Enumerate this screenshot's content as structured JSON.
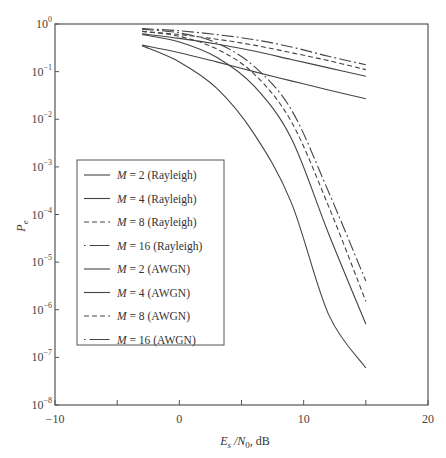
{
  "chart_data": {
    "type": "line",
    "title": "",
    "xlabel": "Es/N0, dB",
    "xlabel_parts": {
      "main": "E",
      "sub1": "s",
      "mid": " /N",
      "sub2": "0",
      "tail": ", dB"
    },
    "ylabel": "Pe",
    "ylabel_parts": {
      "main": "P",
      "sub": "e"
    },
    "xlim": [
      -10,
      20
    ],
    "ylim": [
      1e-08,
      1
    ],
    "yscale": "log",
    "grid": false,
    "legend_position": "center-left",
    "x_ticks": [
      {
        "value": -10,
        "label": "−10"
      },
      {
        "value": -5,
        "label": ""
      },
      {
        "value": 0,
        "label": "0"
      },
      {
        "value": 5,
        "label": ""
      },
      {
        "value": 10,
        "label": "10"
      },
      {
        "value": 15,
        "label": ""
      },
      {
        "value": 20,
        "label": "20"
      }
    ],
    "y_ticks": [
      {
        "exp": 0,
        "label": "10",
        "sup": "0"
      },
      {
        "exp": -1,
        "label": "10",
        "sup": "−1"
      },
      {
        "exp": -2,
        "label": "10",
        "sup": "−2"
      },
      {
        "exp": -3,
        "label": "10",
        "sup": "−3"
      },
      {
        "exp": -4,
        "label": "10",
        "sup": "−4"
      },
      {
        "exp": -5,
        "label": "10",
        "sup": "−5"
      },
      {
        "exp": -6,
        "label": "10",
        "sup": "−6"
      },
      {
        "exp": -7,
        "label": "10",
        "sup": "−7"
      },
      {
        "exp": -8,
        "label": "10",
        "sup": "−8"
      }
    ],
    "x": [
      -3,
      0,
      3,
      6,
      9,
      12,
      15
    ],
    "series": [
      {
        "name": "M = 2 (Rayleigh)",
        "style": "solid",
        "values": [
          0.36,
          0.25,
          0.16,
          0.1,
          0.064,
          0.041,
          0.027
        ]
      },
      {
        "name": "M = 4 (Rayleigh)",
        "style": "solid",
        "values": [
          0.62,
          0.5,
          0.38,
          0.27,
          0.18,
          0.12,
          0.08
        ]
      },
      {
        "name": "M = 8 (Rayleigh)",
        "style": "dashed",
        "values": [
          0.7,
          0.6,
          0.48,
          0.36,
          0.25,
          0.17,
          0.11
        ]
      },
      {
        "name": "M = 16 (Rayleigh)",
        "style": "dashdot",
        "values": [
          0.8,
          0.72,
          0.6,
          0.47,
          0.33,
          0.21,
          0.14
        ]
      },
      {
        "name": "M = 2 (AWGN)",
        "style": "solid",
        "values": [
          0.35,
          0.16,
          0.045,
          0.005,
          0.00018,
          8e-07,
          6e-08
        ]
      },
      {
        "name": "M = 4 (AWGN)",
        "style": "solid",
        "values": [
          0.6,
          0.42,
          0.2,
          0.05,
          0.004,
          4e-05,
          5e-07
        ]
      },
      {
        "name": "M = 8 (AWGN)",
        "style": "dashed",
        "values": [
          0.7,
          0.55,
          0.3,
          0.09,
          0.009,
          0.00015,
          1.5e-06
        ]
      },
      {
        "name": "M = 16 (AWGN)",
        "style": "dashdot",
        "values": [
          0.78,
          0.65,
          0.4,
          0.13,
          0.016,
          0.0003,
          4e-06
        ]
      }
    ]
  },
  "legend": {
    "items": [
      {
        "label": "M = 2 (Rayleigh)"
      },
      {
        "label": "M = 4 (Rayleigh)"
      },
      {
        "label": "M = 8 (Rayleigh)"
      },
      {
        "label": "M = 16 (Rayleigh)"
      },
      {
        "label": "M = 2 (AWGN)"
      },
      {
        "label": "M = 4 (AWGN)"
      },
      {
        "label": "M = 8 (AWGN)"
      },
      {
        "label": "M = 16 (AWGN)"
      }
    ]
  }
}
